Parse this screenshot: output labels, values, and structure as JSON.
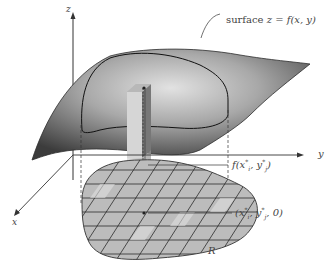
{
  "figure": {
    "type": "diagram",
    "colors": {
      "surface_dark": "#3a3a3a",
      "surface_mid": "#8a8a8a",
      "surface_light": "#d0d0d0",
      "region_fill": "#b9b9b9",
      "region_light": "#d6d6d6",
      "axis": "#333333",
      "label": "#444444"
    }
  },
  "labels": {
    "z_axis": "z",
    "y_axis": "y",
    "x_axis": "x",
    "surface": "surface",
    "surface_eq": "z = f(x, y)",
    "height_f": "f(",
    "height_x": "x",
    "height_i": "i",
    "height_star1": "*",
    "height_comma": ", ",
    "height_y": "y",
    "height_j": "j",
    "height_star2": "*",
    "height_close": ")",
    "point_open": "(",
    "point_x": "x",
    "point_i": "i",
    "point_star1": "*",
    "point_comma": ", ",
    "point_y": "y",
    "point_j": "j",
    "point_star2": "*",
    "point_tail": ", 0)",
    "region": "R"
  }
}
